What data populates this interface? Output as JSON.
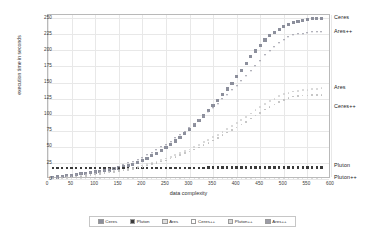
{
  "chart_data": {
    "type": "scatter",
    "title": "",
    "xlabel": "data complexity",
    "ylabel": "execution time in seconds",
    "xlim": [
      0,
      600
    ],
    "ylim": [
      0,
      255
    ],
    "xticks": [
      0,
      50,
      100,
      150,
      200,
      250,
      300,
      350,
      400,
      450,
      500,
      550,
      600
    ],
    "yticks": [
      0,
      25,
      50,
      75,
      100,
      125,
      150,
      175,
      200,
      225,
      250
    ],
    "grid": true,
    "legend_position": "bottom",
    "x": [
      10,
      20,
      30,
      40,
      50,
      60,
      70,
      80,
      90,
      100,
      110,
      120,
      130,
      140,
      150,
      160,
      170,
      180,
      190,
      200,
      210,
      220,
      230,
      240,
      250,
      260,
      270,
      280,
      290,
      300,
      310,
      320,
      330,
      340,
      350,
      360,
      370,
      380,
      390,
      400,
      410,
      420,
      430,
      440,
      450,
      460,
      470,
      480,
      490,
      500,
      510,
      520,
      530,
      540,
      550,
      560,
      570,
      580
    ],
    "series": [
      {
        "name": "Ceres",
        "color": "#8c8f9c",
        "marker": "square",
        "size": 3.2,
        "values": [
          2,
          3,
          4,
          5,
          6,
          7,
          8,
          9,
          10,
          11,
          12,
          13,
          14,
          16,
          17,
          19,
          21,
          23,
          26,
          29,
          32,
          36,
          40,
          44,
          49,
          54,
          59,
          65,
          71,
          77,
          84,
          91,
          98,
          106,
          114,
          122,
          131,
          140,
          149,
          159,
          169,
          179,
          190,
          199,
          208,
          216,
          223,
          228,
          233,
          237,
          240,
          243,
          245,
          247,
          248,
          249,
          250,
          250
        ]
      },
      {
        "name": "Pluton",
        "color": "#3a3a3a",
        "marker": "square",
        "size": 2.4,
        "values": [
          17,
          17,
          17,
          17,
          17,
          17,
          17,
          17,
          17,
          17,
          17,
          17,
          17,
          17,
          17,
          17,
          17,
          17,
          17,
          17,
          17,
          17,
          17,
          17,
          17,
          17,
          17,
          17,
          17,
          17,
          17,
          17,
          17,
          18,
          18,
          18,
          18,
          18,
          18,
          18,
          18,
          18,
          18,
          18,
          18,
          18,
          18,
          18,
          18,
          18,
          18,
          18,
          18,
          18,
          18,
          18,
          18,
          18
        ]
      },
      {
        "name": "Ares",
        "color": "#cfcfcf",
        "marker": "dot",
        "size": 1.8,
        "values": [
          1,
          2,
          2,
          3,
          3,
          4,
          5,
          6,
          7,
          8,
          9,
          10,
          11,
          12,
          13,
          14,
          16,
          17,
          19,
          21,
          23,
          25,
          27,
          29,
          32,
          34,
          37,
          40,
          43,
          46,
          50,
          53,
          57,
          61,
          65,
          69,
          73,
          78,
          82,
          87,
          92,
          97,
          102,
          107,
          112,
          117,
          121,
          125,
          129,
          132,
          134,
          136,
          137,
          138,
          139,
          140,
          140,
          141
        ]
      },
      {
        "name": "Ceres++",
        "color": "#bcbcbc",
        "marker": "dot",
        "size": 1.6,
        "values": [
          1,
          1,
          2,
          2,
          3,
          3,
          4,
          5,
          6,
          7,
          8,
          9,
          10,
          11,
          12,
          13,
          14,
          16,
          17,
          19,
          21,
          23,
          25,
          27,
          29,
          32,
          34,
          37,
          40,
          43,
          46,
          49,
          53,
          56,
          60,
          64,
          68,
          72,
          76,
          80,
          85,
          89,
          94,
          99,
          103,
          108,
          112,
          116,
          120,
          123,
          126,
          128,
          129,
          130,
          130,
          131,
          131,
          131
        ]
      },
      {
        "name": "Pluton++",
        "color": "#d8d8d8",
        "marker": "dot",
        "size": 1.4,
        "values": [
          1,
          1,
          1,
          1,
          1,
          1,
          1,
          1,
          1,
          1,
          1,
          1,
          1,
          1,
          1,
          1,
          1,
          1,
          1,
          1,
          1,
          1,
          1,
          1,
          1,
          1,
          1,
          1,
          1,
          1,
          1,
          1,
          1,
          1,
          1,
          1,
          1,
          1,
          1,
          1,
          1,
          1,
          1,
          1,
          1,
          1,
          1,
          1,
          1,
          1,
          1,
          1,
          1,
          1,
          1,
          1,
          1,
          1
        ]
      },
      {
        "name": "Ares++",
        "color": "#9b9ba6",
        "marker": "tri",
        "size": 2.2,
        "values": [
          1,
          2,
          3,
          4,
          5,
          6,
          7,
          8,
          9,
          10,
          11,
          13,
          15,
          17,
          19,
          21,
          24,
          27,
          30,
          33,
          37,
          41,
          45,
          49,
          53,
          58,
          63,
          68,
          73,
          79,
          85,
          91,
          97,
          104,
          110,
          117,
          124,
          131,
          138,
          145,
          152,
          160,
          168,
          176,
          184,
          192,
          199,
          205,
          211,
          216,
          220,
          223,
          225,
          226,
          227,
          228,
          228,
          228
        ]
      }
    ],
    "annotations": [
      {
        "text": "Ceres",
        "x": 600,
        "y": 251
      },
      {
        "text": "Ares++",
        "x": 600,
        "y": 228
      },
      {
        "text": "Ares",
        "x": 600,
        "y": 141
      },
      {
        "text": "Ceres++",
        "x": 600,
        "y": 112
      },
      {
        "text": "Pluton",
        "x": 600,
        "y": 20
      },
      {
        "text": "Pluton++",
        "x": 600,
        "y": 2
      }
    ]
  },
  "legend": {
    "items": [
      {
        "label": "Ceres",
        "color": "#8c8f9c"
      },
      {
        "label": "Pluton",
        "color": "#3a3a3a"
      },
      {
        "label": "Ares",
        "color": "#e0e0e0"
      },
      {
        "label": "Ceres++",
        "color": "#ffffff"
      },
      {
        "label": "Pluton++",
        "color": "#dadada"
      },
      {
        "label": "Ares++",
        "color": "#9b9ba6"
      }
    ]
  }
}
